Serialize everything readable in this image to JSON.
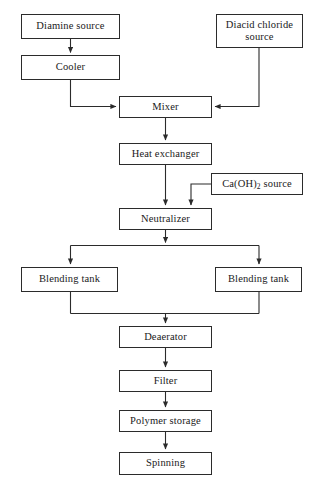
{
  "diagram": {
    "type": "process-flowchart",
    "canvas": {
      "width": 321,
      "height": 492
    },
    "style": {
      "background": "#ffffff",
      "line_color": "#2b2b2b",
      "box_fill": "#ffffff",
      "text_color": "#1a1a1a"
    },
    "nodes": [
      {
        "id": "diamine-source",
        "label": "Diamine source",
        "x": 21,
        "y": 14,
        "w": 99,
        "h": 25
      },
      {
        "id": "cooler",
        "label": "Cooler",
        "x": 21,
        "y": 55,
        "w": 99,
        "h": 25
      },
      {
        "id": "diacid-chloride",
        "label": "Diacid chloride\nsource",
        "x": 216,
        "y": 14,
        "w": 87,
        "h": 34
      },
      {
        "id": "mixer",
        "label": "Mixer",
        "x": 119,
        "y": 96,
        "w": 93,
        "h": 22
      },
      {
        "id": "heat-exchanger",
        "label": "Heat exchanger",
        "x": 119,
        "y": 143,
        "w": 93,
        "h": 22
      },
      {
        "id": "caoh2-source",
        "label": "Ca(OH)2 source",
        "label_html": "Ca(OH)<sub>2</sub> source",
        "x": 211,
        "y": 173,
        "w": 92,
        "h": 22
      },
      {
        "id": "neutralizer",
        "label": "Neutralizer",
        "x": 119,
        "y": 208,
        "w": 93,
        "h": 22
      },
      {
        "id": "blending-tank-left",
        "label": "Blending tank",
        "x": 21,
        "y": 267,
        "w": 97,
        "h": 25
      },
      {
        "id": "blending-tank-right",
        "label": "Blending tank",
        "x": 215,
        "y": 267,
        "w": 87,
        "h": 25
      },
      {
        "id": "deaerator",
        "label": "Deaerator",
        "x": 119,
        "y": 326,
        "w": 93,
        "h": 22
      },
      {
        "id": "filter",
        "label": "Filter",
        "x": 119,
        "y": 370,
        "w": 93,
        "h": 22
      },
      {
        "id": "polymer-storage",
        "label": "Polymer storage",
        "x": 119,
        "y": 410,
        "w": 93,
        "h": 22
      },
      {
        "id": "spinning",
        "label": "Spinning",
        "x": 119,
        "y": 452,
        "w": 93,
        "h": 23
      }
    ],
    "edges": [
      {
        "id": "diamine-to-cooler",
        "from": "diamine-source",
        "to": "cooler"
      },
      {
        "id": "cooler-to-mixer",
        "from": "cooler",
        "to": "mixer"
      },
      {
        "id": "diacid-to-mixer",
        "from": "diacid-chloride",
        "to": "mixer"
      },
      {
        "id": "mixer-to-heat-exchanger",
        "from": "mixer",
        "to": "heat-exchanger"
      },
      {
        "id": "heat-exchanger-to-neutralizer",
        "from": "heat-exchanger",
        "to": "neutralizer"
      },
      {
        "id": "caoh2-to-neutralizer",
        "from": "caoh2-source",
        "to": "neutralizer"
      },
      {
        "id": "neutralizer-to-blending-left",
        "from": "neutralizer",
        "to": "blending-tank-left"
      },
      {
        "id": "neutralizer-to-blending-right",
        "from": "neutralizer",
        "to": "blending-tank-right"
      },
      {
        "id": "blending-left-to-deaerator",
        "from": "blending-tank-left",
        "to": "deaerator"
      },
      {
        "id": "blending-right-to-deaerator",
        "from": "blending-tank-right",
        "to": "deaerator"
      },
      {
        "id": "deaerator-to-filter",
        "from": "deaerator",
        "to": "filter"
      },
      {
        "id": "filter-to-polymer-storage",
        "from": "filter",
        "to": "polymer-storage"
      },
      {
        "id": "polymer-storage-to-spinning",
        "from": "polymer-storage",
        "to": "spinning"
      }
    ]
  }
}
